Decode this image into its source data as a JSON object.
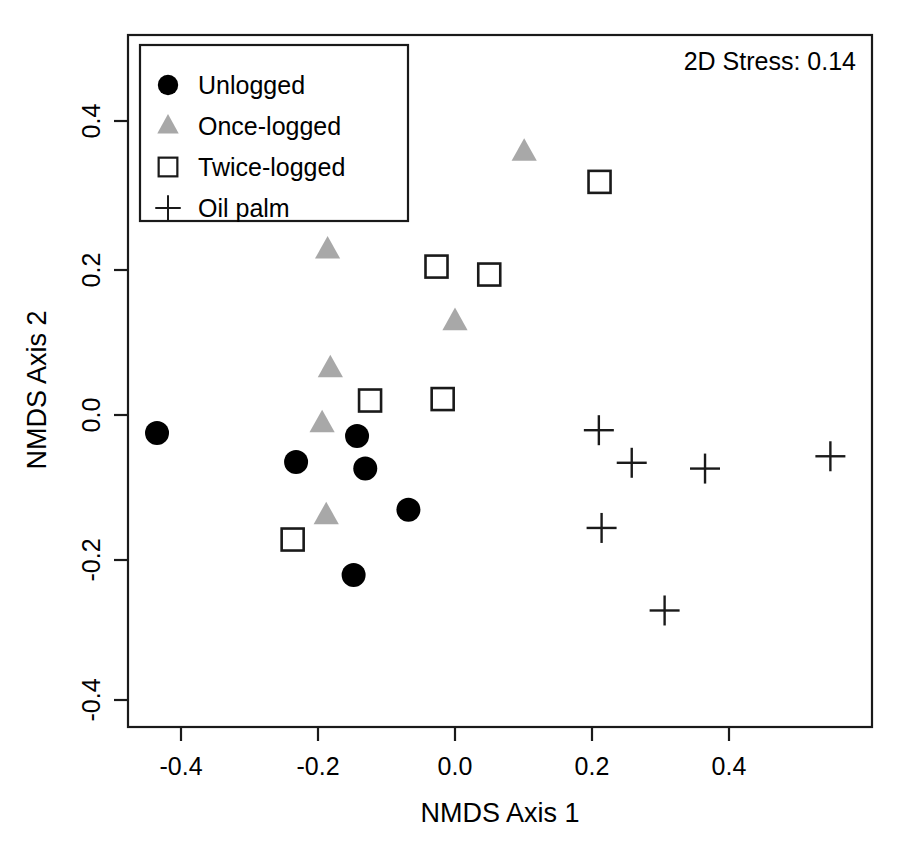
{
  "chart_data": {
    "type": "scatter",
    "title": "",
    "xlabel": "NMDS Axis 1",
    "ylabel": "NMDS Axis 2",
    "xlim": [
      -0.52,
      0.61
    ],
    "ylim": [
      -0.49,
      0.47
    ],
    "xticks": [
      "-0.4",
      "-0.2",
      "0.0",
      "0.2",
      "0.4"
    ],
    "xtickvalues": [
      -0.4,
      -0.2,
      0.0,
      0.2,
      0.4
    ],
    "yticks": [
      "0.4",
      "0.2",
      "0.0",
      "-0.2",
      "-0.4"
    ],
    "ytickvalues": [
      0.4,
      0.2,
      0.0,
      -0.2,
      -0.4
    ],
    "grid": false,
    "legend_position": "top-left",
    "annotations": [
      {
        "name": "stress-annotation",
        "text": "2D Stress: 0.14",
        "position": "top-right"
      }
    ],
    "series": [
      {
        "name": "Unlogged",
        "marker": "filled-circle",
        "color": "#000000",
        "points": [
          {
            "x": -0.435,
            "y": -0.025
          },
          {
            "x": -0.232,
            "y": -0.065
          },
          {
            "x": -0.143,
            "y": -0.029
          },
          {
            "x": -0.131,
            "y": -0.074
          },
          {
            "x": -0.068,
            "y": -0.131
          },
          {
            "x": -0.148,
            "y": -0.221
          }
        ]
      },
      {
        "name": "Once-logged",
        "marker": "filled-triangle",
        "color": "#a8a8a8",
        "points": [
          {
            "x": -0.186,
            "y": 0.228
          },
          {
            "x": 0.101,
            "y": 0.363
          },
          {
            "x": 0.0,
            "y": 0.129
          },
          {
            "x": -0.182,
            "y": 0.064
          },
          {
            "x": -0.194,
            "y": -0.012
          },
          {
            "x": -0.188,
            "y": -0.139
          }
        ]
      },
      {
        "name": "Twice-logged",
        "marker": "open-square",
        "color": "#1a1a1a",
        "points": [
          {
            "x": 0.211,
            "y": 0.322
          },
          {
            "x": -0.027,
            "y": 0.205
          },
          {
            "x": 0.05,
            "y": 0.194
          },
          {
            "x": -0.124,
            "y": 0.02
          },
          {
            "x": -0.018,
            "y": 0.022
          },
          {
            "x": -0.237,
            "y": -0.172
          }
        ]
      },
      {
        "name": "Oil palm",
        "marker": "plus",
        "color": "#1a1a1a",
        "points": [
          {
            "x": 0.21,
            "y": -0.021
          },
          {
            "x": 0.258,
            "y": -0.066
          },
          {
            "x": 0.365,
            "y": -0.074
          },
          {
            "x": 0.548,
            "y": -0.057
          },
          {
            "x": 0.214,
            "y": -0.156
          },
          {
            "x": 0.306,
            "y": -0.27
          }
        ]
      }
    ]
  },
  "legend": {
    "items": [
      {
        "label": "Unlogged",
        "marker": "filled-circle"
      },
      {
        "label": "Once-logged",
        "marker": "filled-triangle"
      },
      {
        "label": "Twice-logged",
        "marker": "open-square"
      },
      {
        "label": "Oil palm",
        "marker": "plus"
      }
    ]
  }
}
